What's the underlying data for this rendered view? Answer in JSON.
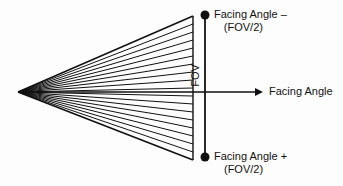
{
  "figure": {
    "kind": "field-of-view-geometry-diagram",
    "background_color": "#fdfdfd",
    "line_color": "#111111"
  },
  "labels": {
    "top_line1": "Facing Angle –",
    "top_line2": "(FOV/2)",
    "bottom_line1": "Facing Angle +",
    "bottom_line2": "(FOV/2)",
    "axis_label": "Facing Angle",
    "fov_label": "FOV"
  },
  "geometry": {
    "apex_x": 18,
    "apex_y": 92,
    "fan_right_x": 193,
    "fan_top_y": 16,
    "fan_bottom_y": 160,
    "fov_line_x": 205,
    "fov_top_y": 15,
    "fov_bottom_y": 157,
    "axis_y": 92,
    "axis_end_x": 263,
    "ray_count": 19,
    "endpoint_dot_radius": 4.5
  }
}
